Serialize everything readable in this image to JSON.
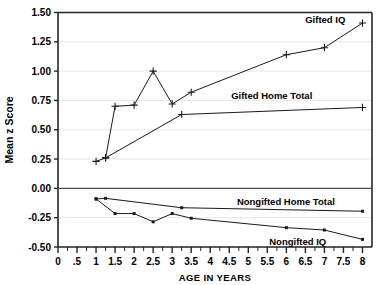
{
  "chart_data": {
    "type": "line",
    "title": "",
    "xlabel": "AGE IN YEARS",
    "ylabel": "Mean z Score",
    "xlim": [
      0,
      8.25
    ],
    "ylim": [
      -0.5,
      1.5
    ],
    "grid": true,
    "grid_axis": "y",
    "legend_position": "inline-annotations",
    "yticks": [
      -0.5,
      -0.25,
      0.0,
      0.25,
      0.5,
      0.75,
      1.0,
      1.25,
      1.5
    ],
    "ytick_labels": [
      "-0.50",
      "-0.25",
      "0.00",
      "0.25",
      "0.50",
      "0.75",
      "1.00",
      "1.25",
      "1.50"
    ],
    "xticks": [
      0,
      0.5,
      1,
      1.5,
      2,
      2.5,
      3,
      3.5,
      4,
      4.5,
      5,
      5.5,
      6,
      6.5,
      7,
      7.5,
      8
    ],
    "xtick_labels": [
      "0",
      ".5",
      "1",
      "1.5",
      "2",
      "2.5",
      "3",
      "3.5",
      "4",
      "4.5",
      "5",
      "5.5",
      "6",
      "6.5",
      "7",
      "7.5",
      "8"
    ],
    "xminor_step": 0.25,
    "series": [
      {
        "name": "Gifted IQ",
        "marker": "plus",
        "color": "#1a1a1a",
        "label_anchor": "end",
        "label_x": 7.55,
        "label_y": 1.44,
        "x": [
          1.0,
          1.25,
          1.5,
          2.0,
          2.5,
          3.0,
          3.5,
          6.0,
          7.0,
          8.0
        ],
        "values": [
          0.23,
          0.26,
          0.7,
          0.71,
          1.0,
          0.72,
          0.82,
          1.14,
          1.2,
          1.41
        ]
      },
      {
        "name": "Gifted Home Total",
        "marker": "plus",
        "color": "#1a1a1a",
        "label_anchor": "start",
        "label_x": 4.55,
        "label_y": 0.79,
        "x": [
          1.25,
          3.25,
          8.0
        ],
        "values": [
          0.26,
          0.63,
          0.69
        ]
      },
      {
        "name": "Nongifted Home Total",
        "marker": "dot",
        "color": "#1a1a1a",
        "label_anchor": "start",
        "label_x": 4.7,
        "label_y": -0.115,
        "x": [
          1.0,
          1.25,
          3.25,
          8.0
        ],
        "values": [
          -0.09,
          -0.085,
          -0.165,
          -0.195
        ]
      },
      {
        "name": "Nongifted IQ",
        "marker": "dot",
        "color": "#1a1a1a",
        "label_anchor": "start",
        "label_x": 5.55,
        "label_y": -0.45,
        "x": [
          1.0,
          1.5,
          2.0,
          2.5,
          3.0,
          3.5,
          6.0,
          7.0,
          8.0
        ],
        "values": [
          -0.09,
          -0.215,
          -0.215,
          -0.285,
          -0.215,
          -0.255,
          -0.335,
          -0.355,
          -0.435
        ]
      }
    ]
  }
}
